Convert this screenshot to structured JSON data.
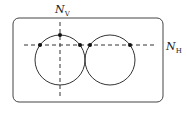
{
  "diagram": {
    "labels": {
      "vertical_line": {
        "main": "N",
        "sub": "V"
      },
      "horizontal_line": {
        "main": "N",
        "sub": "H"
      }
    },
    "shapes": {
      "frame": "rounded rectangle",
      "circles": 2,
      "dashed_lines": [
        "horizontal",
        "vertical"
      ],
      "marked_points": 5
    },
    "colors": {
      "stroke": "#333333",
      "background": "#ffffff"
    }
  }
}
